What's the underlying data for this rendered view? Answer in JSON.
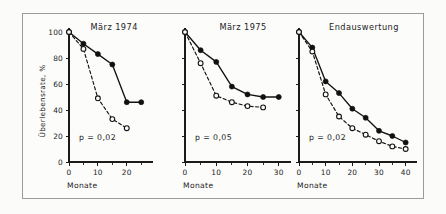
{
  "figure": {
    "background_color": "#fbfbfa",
    "frame_color": "#9b9b9b",
    "ink_color": "#121212"
  },
  "axes": {
    "y_label": "Überlebensrate, %",
    "x_label": "Monate",
    "y_ticks": [
      "0",
      "20",
      "40",
      "60",
      "80",
      "100"
    ]
  },
  "chart_data": [
    {
      "type": "line",
      "title": "März 1974",
      "annotation": "p = 0,02",
      "xlabel": "Monate",
      "ylabel": "Überlebensrate, %",
      "xlim": [
        0,
        27
      ],
      "ylim": [
        0,
        100
      ],
      "x_ticks": [
        0,
        10,
        20
      ],
      "x_tick_labels": [
        "0",
        "10",
        "20"
      ],
      "x_minor_ticks": [
        5,
        15,
        25
      ],
      "y_ticks": [
        0,
        20,
        40,
        60,
        80,
        100
      ],
      "grid": false,
      "legend": "none",
      "series": [
        {
          "name": "filled-circles",
          "marker": "filled-circle",
          "linestyle": "solid",
          "x": [
            0,
            5,
            10,
            15,
            20,
            25
          ],
          "values": [
            100,
            91,
            83,
            75,
            46,
            46
          ]
        },
        {
          "name": "open-circles",
          "marker": "open-circle",
          "linestyle": "dashed",
          "x": [
            0,
            5,
            10,
            15,
            20
          ],
          "values": [
            100,
            87,
            49,
            33,
            26
          ]
        }
      ]
    },
    {
      "type": "line",
      "title": "März 1975",
      "annotation": "p = 0,05",
      "xlabel": "Monate",
      "ylabel": "Überlebensrate, %",
      "xlim": [
        0,
        32
      ],
      "ylim": [
        0,
        100
      ],
      "x_ticks": [
        0,
        10,
        20,
        30
      ],
      "x_tick_labels": [
        "0",
        "10",
        "20",
        "30"
      ],
      "x_minor_ticks": [
        5,
        15,
        25
      ],
      "y_ticks": [
        0,
        20,
        40,
        60,
        80,
        100
      ],
      "grid": false,
      "legend": "none",
      "series": [
        {
          "name": "filled-circles",
          "marker": "filled-circle",
          "linestyle": "solid",
          "x": [
            0,
            5,
            10,
            15,
            20,
            25,
            30
          ],
          "values": [
            100,
            86,
            77,
            58,
            52,
            50,
            50
          ]
        },
        {
          "name": "open-circles",
          "marker": "open-circle",
          "linestyle": "dashed",
          "x": [
            0,
            5,
            10,
            15,
            20,
            25
          ],
          "values": [
            100,
            76,
            51,
            46,
            43,
            42
          ]
        }
      ]
    },
    {
      "type": "line",
      "title": "Endauswertung",
      "annotation": "p = 0,02",
      "xlabel": "Monate",
      "ylabel": "Überlebensrate, %",
      "xlim": [
        0,
        42
      ],
      "ylim": [
        0,
        100
      ],
      "x_ticks": [
        0,
        10,
        20,
        30,
        40
      ],
      "x_tick_labels": [
        "0",
        "10",
        "20",
        "30",
        "40"
      ],
      "x_minor_ticks": [
        5,
        15,
        25,
        35
      ],
      "y_ticks": [
        0,
        20,
        40,
        60,
        80,
        100
      ],
      "grid": false,
      "legend": "none",
      "series": [
        {
          "name": "filled-circles",
          "marker": "filled-circle",
          "linestyle": "solid",
          "x": [
            0,
            5,
            10,
            15,
            20,
            25,
            30,
            35,
            40
          ],
          "values": [
            100,
            88,
            62,
            53,
            41,
            34,
            24,
            20,
            15
          ]
        },
        {
          "name": "open-circles",
          "marker": "open-circle",
          "linestyle": "dashed",
          "x": [
            0,
            5,
            10,
            15,
            20,
            25,
            30,
            35,
            40
          ],
          "values": [
            100,
            85,
            52,
            35,
            26,
            21,
            16,
            12,
            10
          ]
        }
      ]
    }
  ]
}
